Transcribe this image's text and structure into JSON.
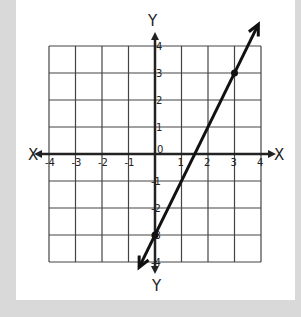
{
  "chart_data": {
    "type": "line",
    "title": "",
    "xlabel": "X",
    "ylabel": "Y",
    "axis_labels": {
      "x_left": "X",
      "x_right": "X",
      "y_top": "Y",
      "y_bottom": "Y"
    },
    "xlim": [
      -4,
      4
    ],
    "ylim": [
      -4,
      4
    ],
    "grid": true,
    "x_ticks": [
      "-4",
      "-3",
      "-2",
      "-1",
      "1",
      "2",
      "3",
      "4"
    ],
    "y_ticks": [
      "4",
      "3",
      "2",
      "1",
      "0",
      "-1",
      "-2",
      "-3",
      "-4"
    ],
    "origin_label": "0",
    "series": [
      {
        "name": "line",
        "equation": "y = 2x - 3",
        "slope": 2,
        "intercept": -3,
        "marked_points": [
          {
            "x": 0,
            "y": -3
          },
          {
            "x": 3,
            "y": 3
          }
        ],
        "arrows": "both ends",
        "extent": {
          "x_start": -0.6,
          "x_end": 3.9
        }
      }
    ]
  },
  "colors": {
    "background": "#d9d9d9",
    "card": "#ffffff",
    "ink": "#222222",
    "grid": "#444444"
  }
}
